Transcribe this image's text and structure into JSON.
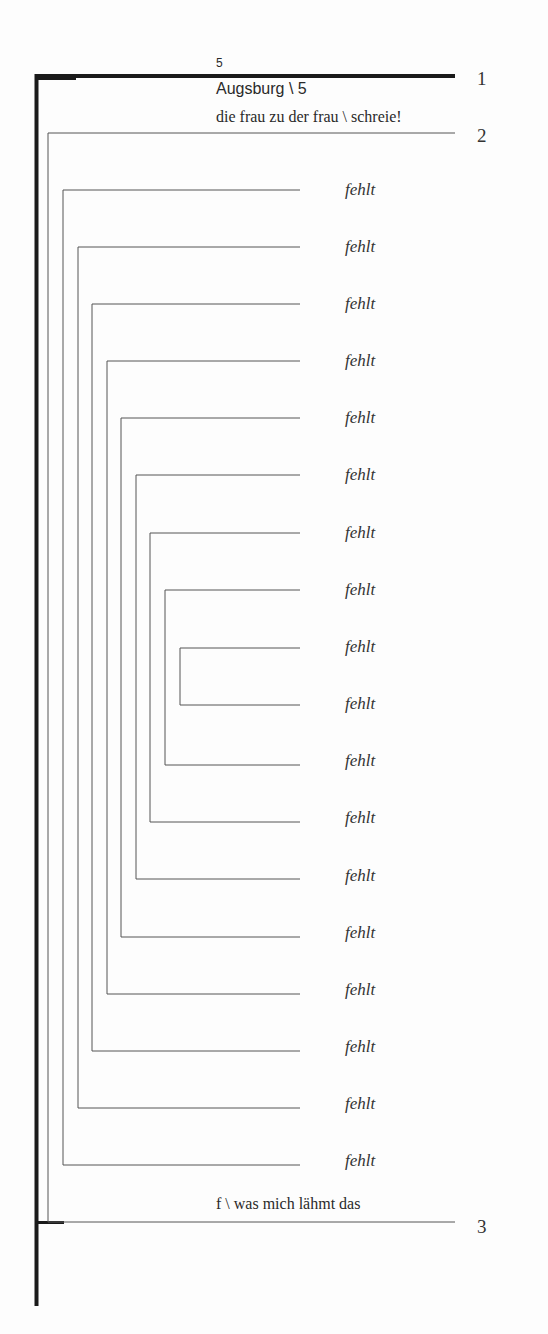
{
  "header": {
    "small_number": "5",
    "place": "Augsburg \\ 5",
    "line_text": "die frau zu der frau \\ schreie!"
  },
  "markers": {
    "one": "1",
    "two": "2",
    "three": "3"
  },
  "footer_text": "f \\ was mich lähmt das",
  "items": [
    "fehlt",
    "fehlt",
    "fehlt",
    "fehlt",
    "fehlt",
    "fehlt",
    "fehlt",
    "fehlt",
    "fehlt",
    "fehlt",
    "fehlt",
    "fehlt",
    "fehlt",
    "fehlt",
    "fehlt",
    "fehlt",
    "fehlt",
    "fehlt"
  ],
  "colors": {
    "thick_line": "#1a1a1a",
    "thin_line": "#555555"
  }
}
